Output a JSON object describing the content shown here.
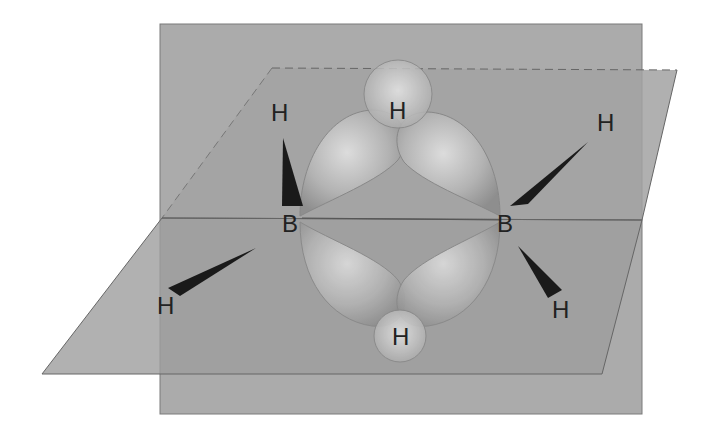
{
  "diagram": {
    "atoms": {
      "boron_left": "B",
      "boron_right": "B",
      "bridge_h_top": "H",
      "bridge_h_bottom": "H",
      "terminal_h_upper_left": "H",
      "terminal_h_upper_right": "H",
      "terminal_h_lower_left": "H",
      "terminal_h_lower_right": "H"
    },
    "colors": {
      "vertical_plane": "#a9a9a9",
      "horizontal_plane": "#9c9c9c",
      "lobe": "#bdbdbd",
      "wedge": "#1a1a1a",
      "label": "#222222"
    }
  }
}
